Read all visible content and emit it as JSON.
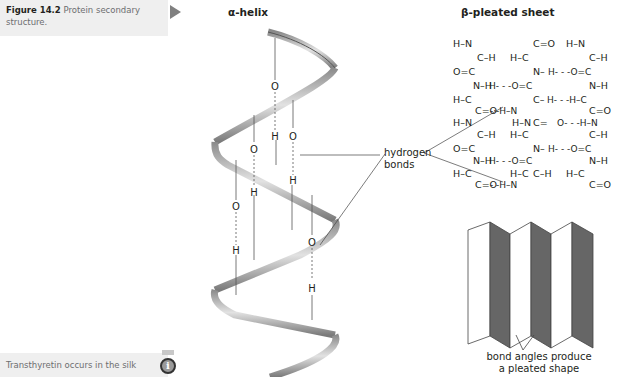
{
  "caption": {
    "figure_number": "Figure 14.2",
    "text": "Protein secondary structure."
  },
  "note": {
    "text": "Transthyretin occurs in the silk",
    "icon": "info-icon"
  },
  "alpha_helix": {
    "title": "α-helix",
    "atoms": [
      "O",
      "H",
      "O",
      "O",
      "H",
      "H",
      "O",
      "H",
      "O",
      "H"
    ]
  },
  "hydrogen_bonds_label": {
    "line1": "hydrogen",
    "line2": "bonds"
  },
  "beta_sheet": {
    "title": "β-pleated sheet",
    "strand_left": [
      "H–N",
      "C–H",
      "O=C",
      "N–H",
      "H–C",
      "C=O",
      "H–N",
      "C–H",
      "O=C",
      "N–H",
      "H–C",
      "C=O"
    ],
    "strand_middle": [
      "C=O",
      "H–C",
      "N–H",
      "O=C",
      "C–H",
      "H–N",
      "C=O",
      "H–C",
      "N–H",
      "O=C",
      "C–H",
      "H–N"
    ],
    "strand_right": [
      "H–N",
      "C–H",
      "O=C",
      "N–H",
      "H–C",
      "C=O",
      "H–N",
      "C–H",
      "O=C",
      "N–H",
      "H–C",
      "C=O"
    ]
  },
  "pleat": {
    "label_line1": "bond angles produce",
    "label_line2": "a pleated shape"
  }
}
